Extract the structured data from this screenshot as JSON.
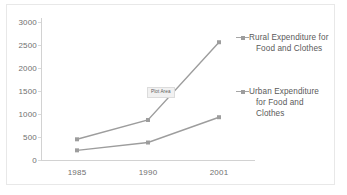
{
  "chart_data": {
    "type": "line",
    "title": "",
    "xlabel": "",
    "ylabel": "",
    "categories": [
      "1985",
      "1990",
      "2001"
    ],
    "x_tick_labels": [
      "1985",
      "1990",
      "2001"
    ],
    "y_tick_labels": [
      "0",
      "500",
      "1000",
      "1500",
      "2000",
      "2500",
      "3000"
    ],
    "y_ticks": [
      0,
      500,
      1000,
      1500,
      2000,
      2500,
      3000
    ],
    "ylim": [
      0,
      3000
    ],
    "grid": false,
    "legend_position": "right",
    "series": [
      {
        "name": "Rural Expenditure for Food and Clothes",
        "name_line1": "Rural Expenditure for",
        "name_line2": "Food and Clothes",
        "color": "#9d9d9d",
        "values": [
          450,
          870,
          2560
        ]
      },
      {
        "name": "Urban Expenditure for Food and Clothes",
        "name_line1": "Urban Expenditure",
        "name_line2": "for Food and Clothes",
        "color": "#9d9d9d",
        "values": [
          210,
          380,
          930
        ]
      }
    ],
    "annotations": [
      {
        "name": "plot-area-tooltip",
        "text": "Plot Area"
      }
    ]
  },
  "axes": {
    "y_tick_0": "0",
    "y_tick_1": "500",
    "y_tick_2": "1000",
    "y_tick_3": "1500",
    "y_tick_4": "2000",
    "y_tick_5": "2500",
    "y_tick_6": "3000",
    "x_tick_0": "1985",
    "x_tick_1": "1990",
    "x_tick_2": "2001"
  },
  "legend": {
    "rural_line1": "Rural Expenditure for",
    "rural_line2": "Food and Clothes",
    "urban_line1": "Urban Expenditure",
    "urban_line2": "for Food and Clothes"
  },
  "tooltip": {
    "plot_area": "Plot Area"
  }
}
